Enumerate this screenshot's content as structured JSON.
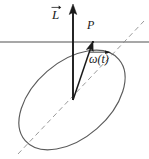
{
  "figure": {
    "background_color": "#ffffff",
    "width": 149,
    "height": 159,
    "labels": {
      "angular_momentum": "L",
      "point": "P",
      "angular_velocity": "ω(t)"
    },
    "colors": {
      "ellipse_stroke": "#5a5a5a",
      "horizontal_line": "#8a8a8a",
      "dashed_axis": "#9a9a9a",
      "vector_stroke": "#1a1a1a",
      "text": "#1a1a1a"
    },
    "geometry": {
      "body_shape": "ellipse",
      "ellipse_center": [
        72,
        100
      ],
      "ellipse_rx": 62,
      "ellipse_ry": 38,
      "ellipse_rotation_deg": -41,
      "horizontal_line_y": 42,
      "horizontal_line_x1": 0,
      "horizontal_line_x2": 149,
      "dashed_axis_start": [
        18,
        154
      ],
      "dashed_axis_end": [
        144,
        21
      ],
      "vector_origin": [
        73,
        100
      ],
      "angular_momentum_tip": [
        73,
        6
      ],
      "point_P": [
        93,
        42
      ],
      "angular_velocity_tip": [
        93,
        43
      ]
    }
  }
}
